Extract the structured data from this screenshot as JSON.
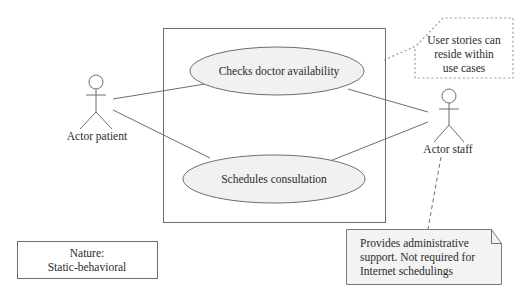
{
  "diagram": {
    "type": "use-case",
    "system_boundary": {
      "label": ""
    },
    "use_cases": [
      {
        "id": "uc1",
        "label": "Checks doctor availability"
      },
      {
        "id": "uc2",
        "label": "Schedules consultation"
      }
    ],
    "actors": [
      {
        "id": "a1",
        "label": "Actor patient"
      },
      {
        "id": "a2",
        "label": "Actor staff"
      }
    ],
    "associations": [
      {
        "from": "a1",
        "to": "uc1"
      },
      {
        "from": "a1",
        "to": "uc2"
      },
      {
        "from": "a2",
        "to": "uc1"
      },
      {
        "from": "a2",
        "to": "uc2"
      }
    ],
    "annotations": {
      "user_stories_note": [
        "User stories can",
        "reside within",
        "use cases"
      ],
      "staff_note": [
        "Provides administrative",
        "support. Not required for",
        "Internet schedulings"
      ],
      "nature_box": [
        "Nature:",
        "Static-behavioral"
      ]
    }
  }
}
